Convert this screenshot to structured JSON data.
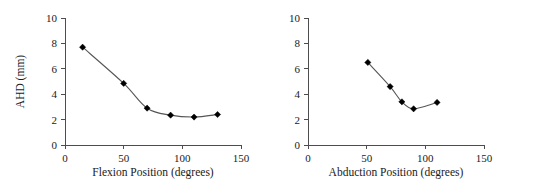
{
  "figure": {
    "background": "#ffffff",
    "panel_count": 2,
    "marker_color": "#000000",
    "line_color": "#555555",
    "axis_color": "#4d4d4d"
  },
  "chart_data": [
    {
      "type": "line",
      "title": "",
      "xlabel": "Flexion Position (degrees)",
      "ylabel": "AHD (mm)",
      "xlim": [
        0,
        150
      ],
      "ylim": [
        0,
        10
      ],
      "xticks": [
        0,
        50,
        100,
        150
      ],
      "yticks": [
        0,
        2,
        4,
        6,
        8,
        10
      ],
      "xtick_labels": [
        "0",
        "50",
        "100",
        "150"
      ],
      "ytick_labels": [
        "0",
        "2",
        "4",
        "6",
        "8",
        "10"
      ],
      "grid": false,
      "legend": false,
      "marker": "filled-diamond",
      "x": [
        15,
        50,
        70,
        90,
        110,
        130
      ],
      "y": [
        7.7,
        4.85,
        2.9,
        2.35,
        2.2,
        2.4
      ]
    },
    {
      "type": "line",
      "title": "",
      "xlabel": "Abduction Position (degrees)",
      "ylabel": "",
      "xlim": [
        0,
        150
      ],
      "ylim": [
        0,
        10
      ],
      "xticks": [
        0,
        50,
        100,
        150
      ],
      "yticks": [
        0,
        2,
        4,
        6,
        8,
        10
      ],
      "xtick_labels": [
        "0",
        "50",
        "100",
        "150"
      ],
      "ytick_labels": [
        "0",
        "2",
        "4",
        "6",
        "8",
        "10"
      ],
      "grid": false,
      "legend": false,
      "marker": "filled-diamond",
      "x": [
        51,
        70,
        80,
        90,
        110
      ],
      "y": [
        6.5,
        4.6,
        3.4,
        2.85,
        3.35
      ]
    }
  ]
}
